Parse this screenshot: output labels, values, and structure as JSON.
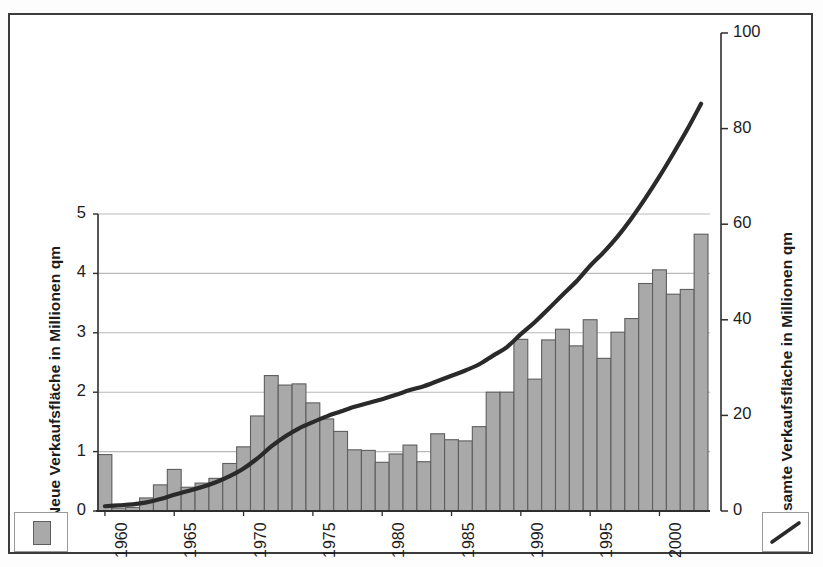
{
  "chart_data": {
    "type": "bar",
    "title": "",
    "subtitle": "",
    "xlabel": "",
    "ylabel": "Neue Verkaufsfläche in Millionen qm",
    "y2label": "Gesamte Verkaufsfläche in Millionen qm",
    "ylim": [
      0,
      5
    ],
    "y2lim": [
      0,
      100
    ],
    "grid": true,
    "legend_position": "bottom-outside",
    "y_ticks": [
      "0",
      "1",
      "2",
      "3",
      "4",
      "5"
    ],
    "y_tick_values": [
      0,
      1,
      2,
      3,
      4,
      5
    ],
    "y2_ticks": [
      "0",
      "20",
      "40",
      "60",
      "80",
      "100"
    ],
    "y2_tick_values": [
      0,
      20,
      40,
      60,
      80,
      100
    ],
    "x_tick_labels": [
      "1960",
      "1965",
      "1970",
      "1975",
      "1980",
      "1985",
      "1990",
      "1995",
      "2000"
    ],
    "x_tick_years": [
      1960,
      1965,
      1970,
      1975,
      1980,
      1985,
      1990,
      1995,
      2000
    ],
    "categories": [
      "1960",
      "1961",
      "1962",
      "1963",
      "1964",
      "1965",
      "1966",
      "1967",
      "1968",
      "1969",
      "1970",
      "1971",
      "1972",
      "1973",
      "1974",
      "1975",
      "1976",
      "1977",
      "1978",
      "1979",
      "1980",
      "1981",
      "1982",
      "1983",
      "1984",
      "1985",
      "1986",
      "1987",
      "1988",
      "1989",
      "1990",
      "1991",
      "1992",
      "1993",
      "1994",
      "1995",
      "1996",
      "1997",
      "1998",
      "1999",
      "2000",
      "2001",
      "2002",
      "2003"
    ],
    "series": [
      {
        "name": "Neue Verkaufsfläche",
        "axis": "left",
        "render": "bar",
        "color": "#a9a9a9",
        "edge_color": "#5e5e5e",
        "values": [
          0.95,
          0.05,
          0.06,
          0.22,
          0.44,
          0.7,
          0.4,
          0.47,
          0.55,
          0.8,
          1.08,
          1.6,
          2.28,
          2.12,
          2.14,
          1.82,
          1.55,
          1.34,
          1.03,
          1.02,
          0.82,
          0.96,
          1.11,
          0.83,
          1.3,
          1.2,
          1.18,
          1.42,
          2.0,
          2.0,
          2.89,
          2.22,
          2.88,
          3.06,
          2.78,
          3.22,
          2.57,
          3.01,
          3.24,
          3.83,
          4.06,
          3.65,
          3.73,
          4.66
        ]
      },
      {
        "name": "Gesamte Verkaufsfläche",
        "axis": "right",
        "render": "line",
        "color": "#2a2a2a",
        "values": [
          1.0,
          1.2,
          1.4,
          1.8,
          2.5,
          3.4,
          4.2,
          5.0,
          6.0,
          7.3,
          8.9,
          11.0,
          13.5,
          15.6,
          17.3,
          18.6,
          19.8,
          20.8,
          21.8,
          22.6,
          23.4,
          24.3,
          25.3,
          26.1,
          27.2,
          28.3,
          29.4,
          30.7,
          32.5,
          34.3,
          37.0,
          39.5,
          42.3,
          45.2,
          48.0,
          51.3,
          54.2,
          57.5,
          61.3,
          65.5,
          70.0,
          74.8,
          79.8,
          85.2
        ]
      }
    ]
  },
  "legend": {
    "bars_swatch_name": "bar-series-swatch",
    "line_swatch_name": "line-series-swatch"
  }
}
